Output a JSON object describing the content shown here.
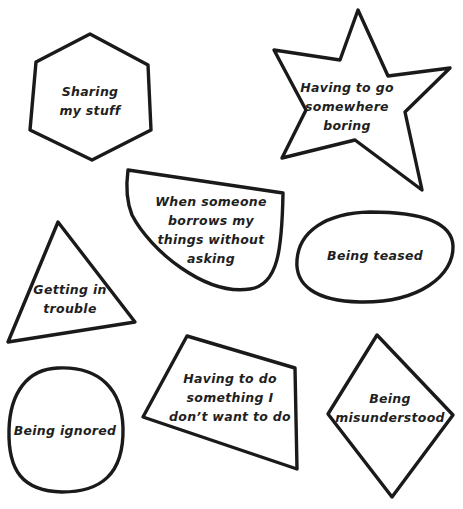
{
  "worksheet": {
    "top_caption_cropped": "",
    "shapes": [
      {
        "id": "hexagon",
        "shape": "hexagon",
        "label_lines": [
          "Sharing",
          "my stuff"
        ]
      },
      {
        "id": "star",
        "shape": "star",
        "label_lines": [
          "Having to go",
          "somewhere",
          "boring"
        ]
      },
      {
        "id": "bowl",
        "shape": "semicircle",
        "label_lines": [
          "When someone",
          "borrows my",
          "things without",
          "asking"
        ]
      },
      {
        "id": "oval",
        "shape": "oval",
        "label_lines": [
          "Being teased"
        ]
      },
      {
        "id": "triangle",
        "shape": "triangle",
        "label_lines": [
          "Getting in",
          "trouble"
        ]
      },
      {
        "id": "circle",
        "shape": "circle",
        "label_lines": [
          "Being ignored"
        ]
      },
      {
        "id": "trapezoid",
        "shape": "quadrilateral",
        "label_lines": [
          "Having to do",
          "something I",
          "don’t want to do"
        ]
      },
      {
        "id": "diamond",
        "shape": "diamond",
        "label_lines": [
          "Being",
          "misunderstood"
        ]
      }
    ],
    "colors": {
      "stroke": "#1a1a1a",
      "text": "#1f1f1f",
      "background": "#ffffff"
    }
  }
}
